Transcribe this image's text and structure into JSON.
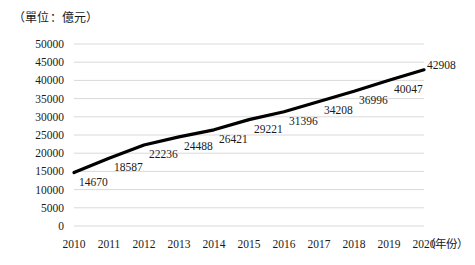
{
  "chart_data": {
    "type": "line",
    "title": "",
    "subtitle": "",
    "unit_note": "（單位：億元）",
    "xlabel": "（年份）",
    "ylabel": "",
    "categories": [
      "2010",
      "2011",
      "2012",
      "2013",
      "2014",
      "2015",
      "2016",
      "2017",
      "2018",
      "2019",
      "2020"
    ],
    "values": [
      14670,
      18587,
      22236,
      24488,
      26421,
      29221,
      31396,
      34208,
      36996,
      40047,
      42908
    ],
    "data_labels": [
      "14670",
      "18587",
      "22236",
      "24488",
      "26421",
      "29221",
      "31396",
      "34208",
      "36996",
      "40047",
      "42908"
    ],
    "ylim": [
      0,
      50000
    ],
    "ytick_values": [
      50000,
      45000,
      40000,
      35000,
      30000,
      25000,
      20000,
      15000,
      10000,
      5000,
      0
    ],
    "ytick_labels": [
      "50000",
      "45000",
      "40000",
      "35000",
      "30000",
      "25000",
      "20000",
      "15000",
      "10000",
      "5000",
      "0"
    ],
    "grid": true,
    "legend": "none",
    "series": [
      {
        "name": "",
        "values": [
          14670,
          18587,
          22236,
          24488,
          26421,
          29221,
          31396,
          34208,
          36996,
          40047,
          42908
        ]
      }
    ],
    "colors": {
      "line": "#000000",
      "grid": "#d9d9d9",
      "background": "#ffffff",
      "text": "#1a1a1a"
    }
  }
}
